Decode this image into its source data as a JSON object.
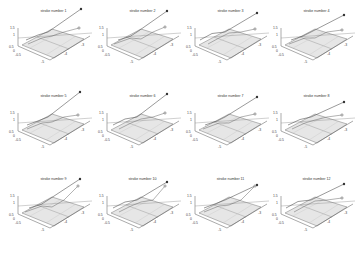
{
  "figure": {
    "title_prefix": "stroke number",
    "panels": [
      {
        "title": "stroke number  1"
      },
      {
        "title": "stroke number  2"
      },
      {
        "title": "stroke number  3"
      },
      {
        "title": "stroke number  4"
      },
      {
        "title": "stroke number  5"
      },
      {
        "title": "stroke number  6"
      },
      {
        "title": "stroke number  7"
      },
      {
        "title": "stroke number  8"
      },
      {
        "title": "stroke number  9"
      },
      {
        "title": "stroke number  10"
      },
      {
        "title": "stroke number  11"
      },
      {
        "title": "stroke number  12"
      }
    ],
    "ticks": {
      "z": [
        "1.5",
        "1"
      ],
      "y": [
        "0.5",
        "0",
        "-0.5"
      ],
      "x": [
        "-5",
        "-4",
        "-3"
      ]
    }
  },
  "chart_data": {
    "type": "line",
    "layout": {
      "rows": 3,
      "cols": 4,
      "projection": "3d"
    },
    "panels": [
      {
        "title": "stroke number 1"
      },
      {
        "title": "stroke number 2"
      },
      {
        "title": "stroke number 3"
      },
      {
        "title": "stroke number 4"
      },
      {
        "title": "stroke number 5"
      },
      {
        "title": "stroke number 6"
      },
      {
        "title": "stroke number 7"
      },
      {
        "title": "stroke number 8"
      },
      {
        "title": "stroke number 9"
      },
      {
        "title": "stroke number 10"
      },
      {
        "title": "stroke number 11"
      },
      {
        "title": "stroke number 12"
      }
    ],
    "zlim": [
      1,
      1.5
    ],
    "ylim": [
      -0.5,
      0.5
    ],
    "xlim": [
      -5,
      -3
    ],
    "z_ticks": [
      1,
      1.5
    ],
    "y_ticks": [
      0.5,
      0,
      -0.5
    ],
    "x_ticks": [
      -5,
      -4,
      -3
    ],
    "grid": false,
    "xlabel": "",
    "ylabel": "",
    "zlabel": ""
  }
}
